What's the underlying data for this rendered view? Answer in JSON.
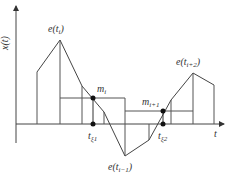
{
  "diagram": {
    "y_axis_label": "x(t)",
    "x_axis_label": "t",
    "labels": {
      "peak_i": {
        "base": "e(t",
        "sub": "i",
        "tail": ")"
      },
      "trough": {
        "base": "e(t",
        "sub": "i−1",
        "tail": ")"
      },
      "peak_i2": {
        "base": "e(t",
        "sub": "i+2",
        "tail": ")"
      },
      "m_i": {
        "base": "m",
        "sub": "i"
      },
      "m_i1": {
        "base": "m",
        "sub": "i+1"
      },
      "t_xi1": {
        "base": "t",
        "sub": "ξ1"
      },
      "t_xi2": {
        "base": "t",
        "sub": "ξ2"
      }
    },
    "colors": {
      "line": "#444444",
      "dot": "#111111",
      "text": "#333333"
    }
  }
}
